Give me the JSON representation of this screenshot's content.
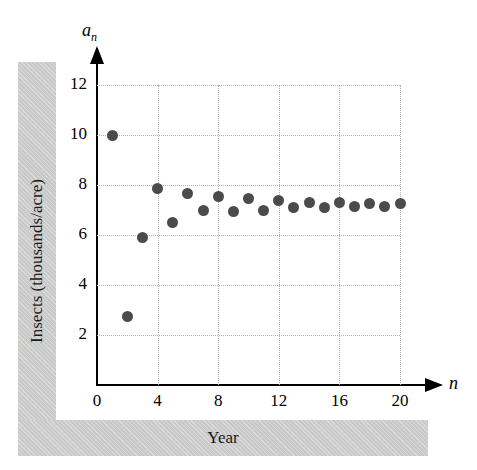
{
  "chart_data": {
    "type": "scatter",
    "title": "",
    "xlabel": "Year",
    "ylabel": "Insects (thousands/acre)",
    "x_axis_symbol": "n",
    "y_axis_symbol": "a",
    "y_axis_symbol_sub": "n",
    "x": [
      1,
      2,
      3,
      4,
      5,
      6,
      7,
      8,
      9,
      10,
      11,
      12,
      13,
      14,
      15,
      16,
      17,
      18,
      19,
      20
    ],
    "values": [
      10.0,
      2.75,
      5.9,
      7.85,
      6.5,
      7.65,
      7.0,
      7.55,
      6.95,
      7.45,
      7.0,
      7.4,
      7.1,
      7.3,
      7.1,
      7.3,
      7.15,
      7.25,
      7.15,
      7.25
    ],
    "xlim": [
      0,
      21.5
    ],
    "ylim": [
      0,
      13
    ],
    "xticks": [
      0,
      4,
      8,
      12,
      16,
      20
    ],
    "xtick_labels": [
      "0",
      "4",
      "8",
      "12",
      "16",
      "20"
    ],
    "yticks": [
      2,
      4,
      6,
      8,
      10,
      12
    ],
    "ytick_labels": [
      "2",
      "4",
      "6",
      "8",
      "10",
      "12"
    ],
    "grid": true,
    "grid_style": "dotted",
    "legend": null,
    "marker_color": "#4b4b4b",
    "grid_color": "#b0b0b0",
    "axis_color": "#000000",
    "band_color": "#c9c9c9"
  }
}
